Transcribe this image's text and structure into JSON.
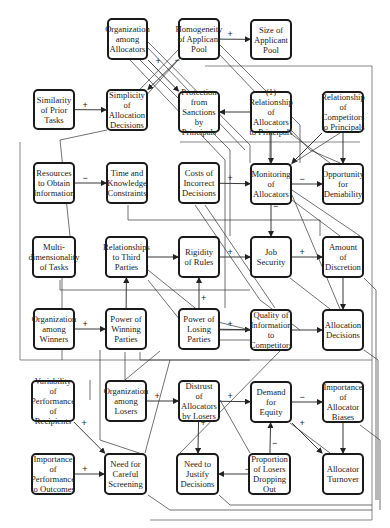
{
  "diagram": {
    "nodes": [
      {
        "id": "org_alloc",
        "label": "Organization among Allocators",
        "x": 107,
        "y": 18,
        "w": 41,
        "h": 42
      },
      {
        "id": "homog",
        "label": "Homogeneity of Applicant Pool",
        "x": 178,
        "y": 18,
        "w": 42,
        "h": 42
      },
      {
        "id": "size",
        "label": "Size of Applicant Pool",
        "x": 250,
        "y": 19,
        "w": 42,
        "h": 41
      },
      {
        "id": "similarity",
        "label": "Similarity of Prior Tasks",
        "x": 33,
        "y": 89,
        "w": 42,
        "h": 41
      },
      {
        "id": "simplicity",
        "label": "Simplicity of Allocation Decisions",
        "x": 106,
        "y": 89,
        "w": 42,
        "h": 42
      },
      {
        "id": "protection",
        "label": "Protection from Sanctions by Principals",
        "x": 178,
        "y": 91,
        "w": 42,
        "h": 42
      },
      {
        "id": "rel_alloc",
        "label": "(1) Relationship of Allocators to Principals",
        "x": 250,
        "y": 91,
        "w": 42,
        "h": 42
      },
      {
        "id": "rel_comp",
        "label": "Relationship of Competitors to Principals",
        "x": 322,
        "y": 91,
        "w": 42,
        "h": 42
      },
      {
        "id": "resources",
        "label": "Resources to Obtain Information",
        "x": 33,
        "y": 162,
        "w": 42,
        "h": 42
      },
      {
        "id": "time",
        "label": "Time and Knowledge Constraints",
        "x": 106,
        "y": 162,
        "w": 42,
        "h": 42
      },
      {
        "id": "costs",
        "label": "Costs of Incorrect Decisions",
        "x": 178,
        "y": 162,
        "w": 42,
        "h": 42
      },
      {
        "id": "monitoring",
        "label": "Monitoring of Allocators",
        "x": 250,
        "y": 163,
        "w": 42,
        "h": 42
      },
      {
        "id": "deniability",
        "label": "Opportunity for Deniability",
        "x": 322,
        "y": 163,
        "w": 42,
        "h": 42
      },
      {
        "id": "multidim",
        "label": "Multi- dimensionality of Tasks",
        "x": 32,
        "y": 236,
        "w": 44,
        "h": 42
      },
      {
        "id": "third",
        "label": "Relationships to Third Parties",
        "x": 105,
        "y": 236,
        "w": 43,
        "h": 42
      },
      {
        "id": "rigidity",
        "label": "Rigidity of Rules",
        "x": 178,
        "y": 236,
        "w": 42,
        "h": 42
      },
      {
        "id": "job",
        "label": "Job Security",
        "x": 250,
        "y": 236,
        "w": 42,
        "h": 42
      },
      {
        "id": "discretion",
        "label": "Amount of Discretion",
        "x": 322,
        "y": 236,
        "w": 42,
        "h": 42
      },
      {
        "id": "org_win",
        "label": "Organization among Winners",
        "x": 33,
        "y": 308,
        "w": 42,
        "h": 42
      },
      {
        "id": "power_win",
        "label": "Power of Winning Parties",
        "x": 105,
        "y": 308,
        "w": 42,
        "h": 42
      },
      {
        "id": "power_lose",
        "label": "Power of Losing Parties",
        "x": 178,
        "y": 308,
        "w": 42,
        "h": 42
      },
      {
        "id": "quality",
        "label": "Quality of Information to Competitors",
        "x": 250,
        "y": 309,
        "w": 42,
        "h": 42
      },
      {
        "id": "alloc_dec",
        "label": "Allocation Decisions",
        "x": 322,
        "y": 309,
        "w": 42,
        "h": 42
      },
      {
        "id": "variability",
        "label": "Variability of Performance of Recipients",
        "x": 31,
        "y": 380,
        "w": 44,
        "h": 42
      },
      {
        "id": "org_lose",
        "label": "Organization among Losers",
        "x": 105,
        "y": 380,
        "w": 42,
        "h": 42
      },
      {
        "id": "distrust",
        "label": "Distrust of Allocators by Losers",
        "x": 178,
        "y": 380,
        "w": 42,
        "h": 42
      },
      {
        "id": "demand",
        "label": "Demand for Equity",
        "x": 250,
        "y": 381,
        "w": 42,
        "h": 42
      },
      {
        "id": "biases",
        "label": "Importance of Allocator Biases",
        "x": 322,
        "y": 381,
        "w": 42,
        "h": 42
      },
      {
        "id": "importance_perf",
        "label": "Importance of Performance to Outcomes",
        "x": 31,
        "y": 453,
        "w": 44,
        "h": 42
      },
      {
        "id": "screening",
        "label": "Need for Careful Screening",
        "x": 104,
        "y": 453,
        "w": 43,
        "h": 42
      },
      {
        "id": "justify",
        "label": "Need to Justify Decisions",
        "x": 176,
        "y": 453,
        "w": 43,
        "h": 42
      },
      {
        "id": "proportion",
        "label": "Proportion of Losers Dropping Out",
        "x": 248,
        "y": 453,
        "w": 43,
        "h": 42
      },
      {
        "id": "turnover",
        "label": "Allocator Turnover",
        "x": 322,
        "y": 453,
        "w": 42,
        "h": 42
      }
    ],
    "edges": [
      {
        "from": "similarity",
        "to": "simplicity",
        "sign": "+"
      },
      {
        "from": "resources",
        "to": "time",
        "sign": "−"
      },
      {
        "from": "org_win",
        "to": "power_win",
        "sign": "+"
      },
      {
        "from": "importance_perf",
        "to": "screening",
        "sign": "+"
      },
      {
        "from": "variability",
        "to": "screening",
        "sign": "+"
      },
      {
        "from": "rel_alloc",
        "to": "protection",
        "sign": ""
      },
      {
        "from": "homog",
        "to": "size",
        "sign": "+"
      },
      {
        "from": "costs",
        "to": "monitoring",
        "sign": "+"
      },
      {
        "from": "monitoring",
        "to": "deniability",
        "sign": "−"
      },
      {
        "from": "job",
        "to": "discretion",
        "sign": "+"
      },
      {
        "from": "discretion",
        "to": "alloc_dec",
        "sign": ""
      },
      {
        "from": "biases",
        "to": "turnover",
        "sign": ""
      },
      {
        "from": "demand",
        "to": "biases",
        "sign": "−"
      },
      {
        "from": "distrust",
        "to": "demand",
        "sign": "+"
      },
      {
        "from": "distrust",
        "to": "justify",
        "sign": "+"
      },
      {
        "from": "proportion",
        "to": "justify",
        "sign": "−"
      },
      {
        "from": "proportion",
        "to": "demand",
        "sign": "−"
      },
      {
        "from": "org_lose",
        "to": "distrust",
        "sign": "+"
      },
      {
        "from": "third",
        "to": "rigidity",
        "sign": ""
      },
      {
        "from": "rigidity",
        "to": "job",
        "sign": "+"
      },
      {
        "from": "power_lose",
        "to": "quality",
        "sign": "+"
      },
      {
        "from": "power_win",
        "to": "third",
        "sign": ""
      },
      {
        "from": "power_lose",
        "to": "rigidity",
        "sign": "+"
      },
      {
        "from": "rel_comp",
        "to": "deniability",
        "sign": ""
      },
      {
        "from": "monitoring",
        "to": "job",
        "sign": "−"
      },
      {
        "from": "demand",
        "to": "turnover",
        "sign": "+"
      },
      {
        "from": "quality",
        "to": "alloc_dec",
        "sign": ""
      },
      {
        "from": "org_alloc",
        "to": "protection",
        "sign": "+"
      },
      {
        "from": "homog",
        "to": "simplicity",
        "sign": "−"
      },
      {
        "from": "rel_alloc",
        "to": "monitoring",
        "sign": ""
      },
      {
        "from": "rel_comp",
        "to": "monitoring",
        "sign": ""
      }
    ]
  }
}
